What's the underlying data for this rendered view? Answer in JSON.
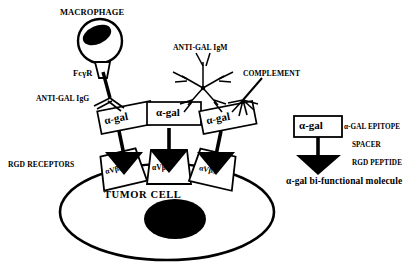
{
  "figure": {
    "background_color": "#ffffff",
    "ink_color": "#000000"
  },
  "labels": {
    "macrophage": "MACROPHAGE",
    "fc_gamma_receptor": "FсγR",
    "anti_gal_igg": "ANTI-GAL IgG",
    "anti_gal_igm": "ANTI-GAL IgM",
    "complement": "COMPLEMENT",
    "rgd_receptors": "RGD RECEPTORS",
    "tumor_cell": "TUMOR CELL"
  },
  "alpha_gal_boxes": [
    {
      "id": "agal-box-1",
      "label": "α-gal"
    },
    {
      "id": "agal-box-2",
      "label": "α-gal"
    },
    {
      "id": "agal-box-3",
      "label": "α-gal"
    },
    {
      "id": "agal-box-legend",
      "label": "α-gal"
    }
  ],
  "receptors": [
    {
      "id": "avb3-receptor-1",
      "label": "αVβ3"
    },
    {
      "id": "avb3-receptor-2",
      "label": "αVβ3"
    },
    {
      "id": "avb3-receptor-3",
      "label": "αVβ3"
    }
  ],
  "legend": {
    "epitope": "α-GAL EPITOPE",
    "spacer": "SPACER",
    "rgd_peptide": "RGD PEPTIDE",
    "caption": "α-gal bi-functional molecule"
  },
  "icons": {
    "macrophage": "macrophage-cell-icon",
    "nucleus": "nucleus-icon",
    "fc_receptor": "fc-receptor-funnel-icon",
    "igg_antibody": "igg-y-antibody-icon",
    "igm_antibody": "igm-pentamer-star-icon",
    "complement": "complement-fan-icon",
    "arrowhead": "rgd-peptide-arrowhead-icon",
    "tumor_cell": "tumor-cell-ellipse-icon"
  }
}
